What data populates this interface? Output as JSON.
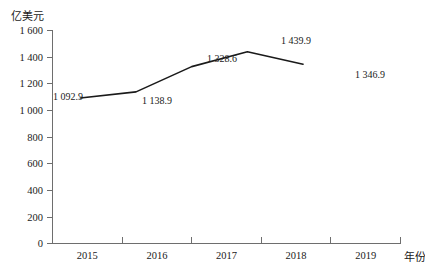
{
  "chart_data": {
    "type": "line",
    "title": "",
    "subtitle": "",
    "xlabel": "年份",
    "ylabel": "亿美元",
    "categories": [
      "2015",
      "2016",
      "2017",
      "2018",
      "2019"
    ],
    "values": [
      1092.9,
      1138.9,
      1328.6,
      1439.9,
      1346.9
    ],
    "point_labels": [
      "1 092.9",
      "1 138.9",
      "1 328.6",
      "1 439.9",
      "1 346.9"
    ],
    "series": [
      {
        "name": "",
        "values": [
          1092.9,
          1138.9,
          1328.6,
          1439.9,
          1346.9
        ]
      }
    ],
    "ylim": [
      0,
      1600
    ],
    "ytick_values": [
      0,
      200,
      400,
      600,
      800,
      1000,
      1200,
      1400,
      1600
    ],
    "ytick_labels": [
      "0",
      "200",
      "400",
      "600",
      "800",
      "1 000",
      "1 200",
      "1 400",
      "1 600"
    ],
    "grid": false,
    "legend": false,
    "legend_position": "none",
    "line_color": "#1a1a1a",
    "axis_color": "#6e6e6e",
    "text_color": "#1a1a1a"
  },
  "labels": {
    "y_axis_title": "亿美元",
    "x_axis_title": "年份",
    "y_0": "0",
    "y_200": "200",
    "y_400": "400",
    "y_600": "600",
    "y_800": "800",
    "y_1000": "1 000",
    "y_1200": "1 200",
    "y_1400": "1 400",
    "y_1600": "1 600",
    "x_2015": "2015",
    "x_2016": "2016",
    "x_2017": "2017",
    "x_2018": "2018",
    "x_2019": "2019",
    "p_2015": "1 092.9",
    "p_2016": "1 138.9",
    "p_2017": "1 328.6",
    "p_2018": "1 439.9",
    "p_2019": "1 346.9"
  }
}
